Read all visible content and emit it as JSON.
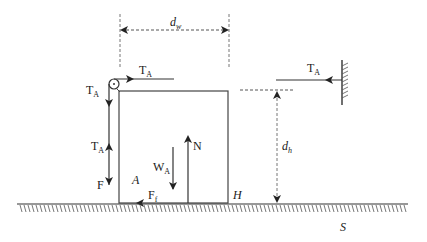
{
  "diagram": {
    "colors": {
      "line": "#3a3a3a",
      "dashed": "#6a6a6a",
      "text": "#1a1a1a"
    },
    "labels": {
      "dw": {
        "main": "d",
        "sub": "w"
      },
      "dh": {
        "main": "d",
        "sub": "h"
      },
      "ta_top": {
        "main": "T",
        "sub": "A"
      },
      "ta_left": {
        "main": "T",
        "sub": "A"
      },
      "ta_left_up": {
        "main": "T",
        "sub": "A"
      },
      "ta_right": {
        "main": "T",
        "sub": "A"
      },
      "f": "F",
      "wa": {
        "main": "W",
        "sub": "A"
      },
      "n": "N",
      "a": "A",
      "ff": {
        "main": "F",
        "sub": "f"
      },
      "h": "H",
      "s": "S"
    },
    "elements": [
      "block A",
      "pulley",
      "rope with tension T_A",
      "wall anchor",
      "ground surface S",
      "dimension d_w",
      "dimension d_h",
      "force F",
      "weight W_A",
      "normal force N",
      "friction F_f"
    ]
  }
}
